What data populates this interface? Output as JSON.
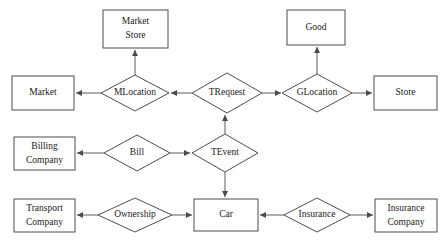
{
  "diagram": {
    "canvas": {
      "width": 448,
      "height": 242
    },
    "style": {
      "background": "#ffffff",
      "entity_stroke": "#4d4d4d",
      "relationship_stroke": "#4d4d4d",
      "edge_stroke": "#5a5a5a",
      "label_color": "#1a1a1a"
    },
    "entities": [
      {
        "id": "market_store",
        "label_line1": "Market",
        "label_line2": "Store",
        "x": 103,
        "y": 10,
        "w": 65,
        "h": 38
      },
      {
        "id": "good",
        "label_line1": "Good",
        "label_line2": "",
        "x": 287,
        "y": 10,
        "w": 58,
        "h": 35
      },
      {
        "id": "market",
        "label_line1": "Market",
        "label_line2": "",
        "x": 12,
        "y": 76,
        "w": 62,
        "h": 34
      },
      {
        "id": "store",
        "label_line1": "Store",
        "label_line2": "",
        "x": 374,
        "y": 76,
        "w": 63,
        "h": 34
      },
      {
        "id": "billing_company",
        "label_line1": "Billing",
        "label_line2": "Company",
        "x": 14,
        "y": 137,
        "w": 61,
        "h": 33
      },
      {
        "id": "transport_company",
        "label_line1": "Transport",
        "label_line2": "Company",
        "x": 14,
        "y": 199,
        "w": 61,
        "h": 33
      },
      {
        "id": "car",
        "label_line1": "Car",
        "label_line2": "",
        "x": 194,
        "y": 199,
        "w": 64,
        "h": 32
      },
      {
        "id": "insurance_company",
        "label_line1": "Insurance",
        "label_line2": "Company",
        "x": 375,
        "y": 199,
        "w": 62,
        "h": 33
      }
    ],
    "relationships": [
      {
        "id": "mlocation",
        "label": "MLocation",
        "cx": 135,
        "cy": 93,
        "rx": 34,
        "ry": 18
      },
      {
        "id": "trequest",
        "label": "TRequest",
        "cx": 227,
        "cy": 93,
        "rx": 35,
        "ry": 20
      },
      {
        "id": "glocation",
        "label": "GLocation",
        "cx": 317,
        "cy": 93,
        "rx": 35,
        "ry": 19
      },
      {
        "id": "bill",
        "label": "Bill",
        "cx": 137,
        "cy": 153,
        "rx": 33,
        "ry": 18
      },
      {
        "id": "tevent",
        "label": "TEvent",
        "cx": 225,
        "cy": 153,
        "rx": 33,
        "ry": 19
      },
      {
        "id": "ownership",
        "label": "Ownership",
        "cx": 135,
        "cy": 215,
        "rx": 37,
        "ry": 17
      },
      {
        "id": "insurance",
        "label": "Insurance",
        "cx": 317,
        "cy": 215,
        "rx": 33,
        "ry": 17
      }
    ],
    "edges": [
      {
        "id": "mlocation-to-market",
        "from": "mlocation",
        "to": "market",
        "direction": "left",
        "x1": 101,
        "y1": 93,
        "x2": 76,
        "y2": 93
      },
      {
        "id": "mlocation-to-market-store",
        "from": "mlocation",
        "to": "market_store",
        "direction": "up",
        "x1": 135,
        "y1": 75,
        "x2": 135,
        "y2": 50
      },
      {
        "id": "trequest-to-mlocation",
        "from": "trequest",
        "to": "mlocation",
        "direction": "left",
        "x1": 192,
        "y1": 93,
        "x2": 171,
        "y2": 93
      },
      {
        "id": "trequest-to-glocation",
        "from": "trequest",
        "to": "glocation",
        "direction": "right",
        "x1": 262,
        "y1": 93,
        "x2": 281,
        "y2": 93
      },
      {
        "id": "glocation-to-good",
        "from": "glocation",
        "to": "good",
        "direction": "up",
        "x1": 317,
        "y1": 74,
        "x2": 317,
        "y2": 47
      },
      {
        "id": "glocation-to-store",
        "from": "glocation",
        "to": "store",
        "direction": "right",
        "x1": 352,
        "y1": 93,
        "x2": 372,
        "y2": 93
      },
      {
        "id": "tevent-to-trequest",
        "from": "tevent",
        "to": "trequest",
        "direction": "up",
        "x1": 225,
        "y1": 134,
        "x2": 225,
        "y2": 115
      },
      {
        "id": "bill-to-billing-company",
        "from": "bill",
        "to": "billing_company",
        "direction": "left",
        "x1": 104,
        "y1": 153,
        "x2": 77,
        "y2": 153
      },
      {
        "id": "bill-to-tevent",
        "from": "bill",
        "to": "tevent",
        "direction": "right",
        "x1": 170,
        "y1": 153,
        "x2": 190,
        "y2": 153
      },
      {
        "id": "tevent-to-car",
        "from": "tevent",
        "to": "car",
        "direction": "down",
        "x1": 225,
        "y1": 172,
        "x2": 225,
        "y2": 197
      },
      {
        "id": "ownership-to-transport-company",
        "from": "ownership",
        "to": "transport_company",
        "direction": "left",
        "x1": 98,
        "y1": 215,
        "x2": 77,
        "y2": 215
      },
      {
        "id": "ownership-to-car",
        "from": "ownership",
        "to": "car",
        "direction": "right",
        "x1": 172,
        "y1": 215,
        "x2": 192,
        "y2": 215
      },
      {
        "id": "insurance-to-car",
        "from": "insurance",
        "to": "car",
        "direction": "left",
        "x1": 284,
        "y1": 215,
        "x2": 260,
        "y2": 215
      },
      {
        "id": "insurance-to-insurance-company",
        "from": "insurance",
        "to": "insurance_company",
        "direction": "right",
        "x1": 350,
        "y1": 215,
        "x2": 373,
        "y2": 215
      }
    ]
  }
}
